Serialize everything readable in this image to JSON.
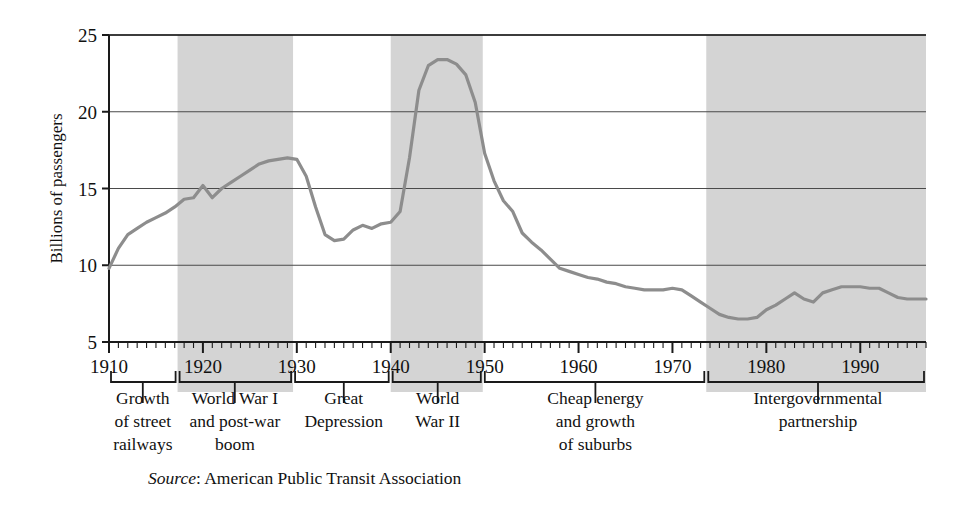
{
  "chart_data": {
    "type": "line",
    "title": "",
    "subtitle": "",
    "xlabel": "",
    "ylabel": "Billions of passengers",
    "xlim": [
      1910,
      1997
    ],
    "ylim": [
      5,
      25
    ],
    "yticks": [
      5,
      10,
      15,
      20,
      25
    ],
    "xticks": [
      1910,
      1920,
      1930,
      1940,
      1950,
      1960,
      1970,
      1980,
      1990
    ],
    "xtick_labels": [
      "1910",
      "1920",
      "1930",
      "1940",
      "1950",
      "1960",
      "1970",
      "1980",
      "1990"
    ],
    "ytick_labels": [
      "5",
      "10",
      "15",
      "20",
      "25"
    ],
    "minor_xtick_interval": 1,
    "grid": "horizontal",
    "legend": "none",
    "series": [
      {
        "name": "Transit passengers",
        "color": "#8d8d8d",
        "x": [
          1910,
          1911,
          1912,
          1913,
          1914,
          1915,
          1916,
          1917,
          1918,
          1919,
          1920,
          1921,
          1922,
          1923,
          1924,
          1925,
          1926,
          1927,
          1928,
          1929,
          1930,
          1931,
          1932,
          1933,
          1934,
          1935,
          1936,
          1937,
          1938,
          1939,
          1940,
          1941,
          1942,
          1943,
          1944,
          1945,
          1946,
          1947,
          1948,
          1949,
          1950,
          1951,
          1952,
          1953,
          1954,
          1955,
          1956,
          1957,
          1958,
          1959,
          1960,
          1961,
          1962,
          1963,
          1964,
          1965,
          1966,
          1967,
          1968,
          1969,
          1970,
          1971,
          1972,
          1973,
          1974,
          1975,
          1976,
          1977,
          1978,
          1979,
          1980,
          1981,
          1982,
          1983,
          1984,
          1985,
          1986,
          1987,
          1988,
          1989,
          1990,
          1991,
          1992,
          1993,
          1994,
          1995,
          1996,
          1997
        ],
        "y": [
          9.8,
          11.1,
          12.0,
          12.4,
          12.8,
          13.1,
          13.4,
          13.8,
          14.3,
          14.4,
          15.2,
          14.4,
          15.0,
          15.4,
          15.8,
          16.2,
          16.6,
          16.8,
          16.9,
          17.0,
          16.9,
          15.8,
          13.8,
          12.0,
          11.6,
          11.7,
          12.3,
          12.6,
          12.4,
          12.7,
          12.8,
          13.5,
          17.0,
          21.4,
          23.0,
          23.4,
          23.4,
          23.1,
          22.4,
          20.6,
          17.3,
          15.5,
          14.2,
          13.5,
          12.1,
          11.5,
          11.0,
          10.4,
          9.8,
          9.6,
          9.4,
          9.2,
          9.1,
          8.9,
          8.8,
          8.6,
          8.5,
          8.4,
          8.4,
          8.4,
          8.5,
          8.4,
          8.0,
          7.6,
          7.2,
          6.8,
          6.6,
          6.5,
          6.5,
          6.6,
          7.1,
          7.4,
          7.8,
          8.2,
          7.8,
          7.6,
          8.2,
          8.4,
          8.6,
          8.6,
          8.6,
          8.5,
          8.5,
          8.2,
          7.9,
          7.8,
          7.8,
          7.8
        ]
      }
    ],
    "shaded_bands": [
      {
        "label": "World War I and post-war boom",
        "start": 1917.3,
        "end": 1929.6,
        "color": "#d4d4d4"
      },
      {
        "label": "World War II",
        "start": 1940.0,
        "end": 1949.8,
        "color": "#d4d4d4"
      },
      {
        "label": "Intergovernmental partnership",
        "start": 1973.6,
        "end": 1997.0,
        "color": "#d4d4d4"
      }
    ],
    "eras": [
      {
        "label_lines": [
          "Growth",
          "of street",
          "railways"
        ],
        "start": 1910,
        "end": 1917.3,
        "center": 1913.6
      },
      {
        "label_lines": [
          "World War I",
          "and post-war",
          "boom"
        ],
        "start": 1917.3,
        "end": 1929.6,
        "center": 1923.4
      },
      {
        "label_lines": [
          "Great",
          "Depression"
        ],
        "start": 1929.6,
        "end": 1940.0,
        "center": 1935.0
      },
      {
        "label_lines": [
          "World",
          "War II"
        ],
        "start": 1940.0,
        "end": 1949.8,
        "center": 1945.0
      },
      {
        "label_lines": [
          "Cheap energy",
          "and growth",
          "of suburbs"
        ],
        "start": 1949.8,
        "end": 1973.6,
        "center": 1961.8
      },
      {
        "label_lines": [
          "Intergovernmental",
          "partnership"
        ],
        "start": 1973.6,
        "end": 1997.0,
        "center": 1985.5
      }
    ]
  },
  "axis": {
    "y_title": "Billions of passengers"
  },
  "source": {
    "prefix": "Source",
    "separator": ": ",
    "text": "American Public Transit Association",
    "full": "Source: American Public Transit Association"
  },
  "colors": {
    "line": "#8d8d8d",
    "band": "#d4d4d4",
    "axis": "#1a1a1a",
    "grid": "#4a4a4a",
    "text": "#111111",
    "background": "#ffffff"
  }
}
